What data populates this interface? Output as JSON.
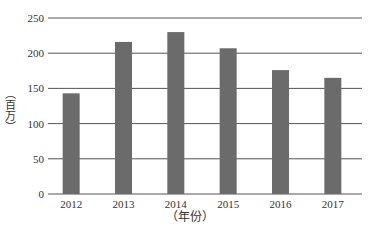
{
  "chart_data": {
    "type": "bar",
    "title": "",
    "xlabel": "（年份）",
    "ylabel": "（百万）",
    "categories": [
      "2012",
      "2013",
      "2014",
      "2015",
      "2016",
      "2017"
    ],
    "values": [
      143,
      216,
      230,
      207,
      176,
      165
    ],
    "ylim": [
      0,
      250
    ],
    "yticks": [
      0,
      50,
      100,
      150,
      200,
      250
    ],
    "grid": true,
    "legend": null,
    "bar_color": "#6b6b6b",
    "grid_color": "#555555"
  }
}
